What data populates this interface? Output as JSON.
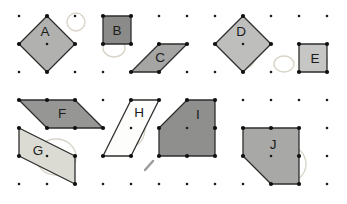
{
  "figure": {
    "canvas": {
      "width": 347,
      "height": 204,
      "background": "#ffffff"
    },
    "grid": {
      "columns": 12,
      "rows": 7,
      "origin_x": 19,
      "origin_y": 16,
      "spacing_x": 28,
      "spacing_y": 28,
      "dot_color": "#1c1c1c",
      "dot_radius": 1.3
    },
    "style": {
      "outline_color": "#2e2e2e",
      "outline_width": 1.3,
      "vertex_dot_radius": 2.1,
      "vertex_dot_color": "#101010",
      "label_color": "#1b1b1b",
      "label_font_size": 13.5,
      "pencil_color": "#d9d5c9",
      "pencil_width": 1.4,
      "slash_color": "#9b9b9b"
    },
    "shapes": [
      {
        "label": "A",
        "kind": "square-rotated-45",
        "fill": "#b1b1af",
        "points": [
          [
            47,
            16
          ],
          [
            75,
            44
          ],
          [
            47,
            72
          ],
          [
            19,
            44
          ]
        ],
        "label_x": 45,
        "label_y": 31
      },
      {
        "label": "B",
        "kind": "square",
        "fill": "#8b8b89",
        "points": [
          [
            103,
            16
          ],
          [
            131,
            16
          ],
          [
            131,
            44
          ],
          [
            103,
            44
          ]
        ],
        "label_x": 117,
        "label_y": 30
      },
      {
        "label": "C",
        "kind": "parallelogram",
        "fill": "#a5a5a3",
        "points": [
          [
            159,
            44
          ],
          [
            187,
            44
          ],
          [
            159,
            72
          ],
          [
            131,
            72
          ]
        ],
        "label_x": 160,
        "label_y": 57
      },
      {
        "label": "D",
        "kind": "square-rotated-45",
        "fill": "#bebebc",
        "points": [
          [
            243,
            16
          ],
          [
            271,
            44
          ],
          [
            243,
            72
          ],
          [
            215,
            44
          ]
        ],
        "label_x": 241,
        "label_y": 31
      },
      {
        "label": "E",
        "kind": "square",
        "fill": "#c6c6c4",
        "points": [
          [
            299,
            44
          ],
          [
            327,
            44
          ],
          [
            327,
            72
          ],
          [
            299,
            72
          ]
        ],
        "label_x": 315,
        "label_y": 58
      },
      {
        "label": "F",
        "kind": "parallelogram",
        "fill": "#969694",
        "points": [
          [
            19,
            100
          ],
          [
            47,
            100
          ],
          [
            75,
            100
          ],
          [
            103,
            128
          ],
          [
            75,
            128
          ],
          [
            47,
            128
          ]
        ],
        "label_x": 62,
        "label_y": 113
      },
      {
        "label": "G",
        "kind": "parallelogram",
        "fill": "#dbdbd3",
        "points": [
          [
            19,
            128
          ],
          [
            75,
            156
          ],
          [
            75,
            184
          ],
          [
            19,
            156
          ]
        ],
        "label_x": 38,
        "label_y": 150
      },
      {
        "label": "H",
        "kind": "parallelogram",
        "fill": "#fdfdfb",
        "points": [
          [
            131,
            100
          ],
          [
            159,
            100
          ],
          [
            131,
            156
          ],
          [
            103,
            156
          ]
        ],
        "label_x": 139,
        "label_y": 112
      },
      {
        "label": "I",
        "kind": "pentagon",
        "fill": "#8f8f8d",
        "points": [
          [
            187,
            100
          ],
          [
            215,
            100
          ],
          [
            215,
            128
          ],
          [
            215,
            156
          ],
          [
            187,
            156
          ],
          [
            159,
            156
          ],
          [
            159,
            128
          ]
        ],
        "label_x": 198,
        "label_y": 114
      },
      {
        "label": "J",
        "kind": "pentagon",
        "fill": "#a8a8a6",
        "points": [
          [
            243,
            128
          ],
          [
            271,
            128
          ],
          [
            299,
            128
          ],
          [
            299,
            156
          ],
          [
            299,
            184
          ],
          [
            271,
            184
          ],
          [
            243,
            156
          ]
        ],
        "label_x": 273,
        "label_y": 144
      }
    ],
    "pencil_marks": {
      "ellipses": [
        {
          "cx": 76,
          "cy": 22,
          "rx": 9,
          "ry": 9
        },
        {
          "cx": 114,
          "cy": 48,
          "rx": 11,
          "ry": 9
        },
        {
          "cx": 245,
          "cy": 51,
          "rx": 12,
          "ry": 17
        },
        {
          "cx": 284,
          "cy": 64,
          "rx": 10,
          "ry": 8
        },
        {
          "cx": 317,
          "cy": 61,
          "rx": 10,
          "ry": 11
        },
        {
          "cx": 56,
          "cy": 157,
          "rx": 20,
          "ry": 18
        },
        {
          "cx": 134,
          "cy": 128,
          "rx": 11,
          "ry": 17
        },
        {
          "cx": 196,
          "cy": 131,
          "rx": 15,
          "ry": 21
        },
        {
          "cx": 288,
          "cy": 164,
          "rx": 18,
          "ry": 18
        }
      ],
      "slash": {
        "x1": 145,
        "y1": 170,
        "x2": 153,
        "y2": 161
      }
    }
  }
}
